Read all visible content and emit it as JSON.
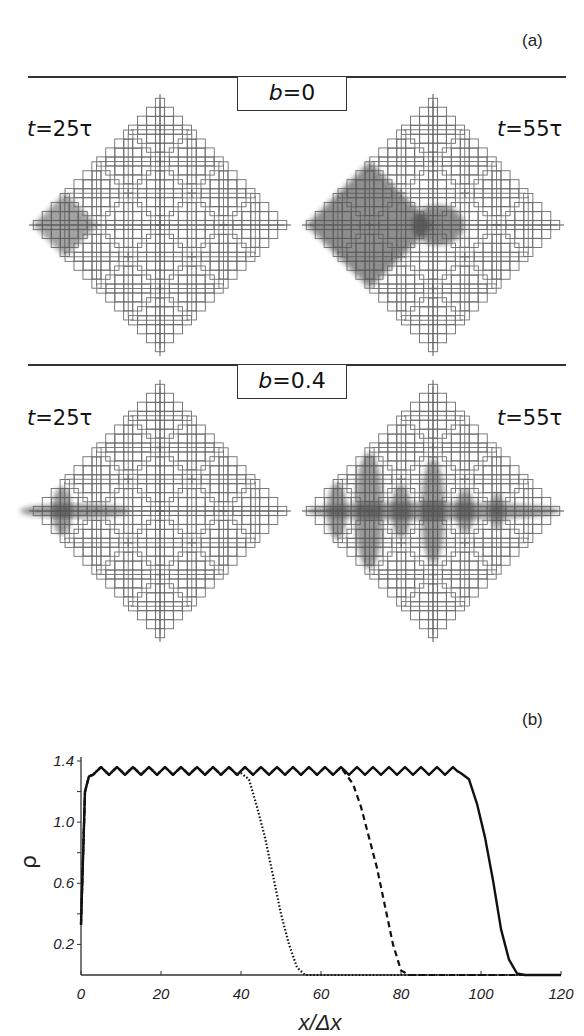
{
  "panel_a": {
    "label": "(a)",
    "rows": [
      {
        "param_var": "b",
        "param_eq": "=0",
        "snapshots": [
          {
            "t_var": "t",
            "t_eq": "=25τ",
            "spread": "left-corner-subsquare"
          },
          {
            "t_var": "t",
            "t_eq": "=55τ",
            "spread": "left-quadrant-filled"
          }
        ]
      },
      {
        "param_var": "b",
        "param_eq": "=0.4",
        "snapshots": [
          {
            "t_var": "t",
            "t_eq": "=25τ",
            "spread": "horizontal-axis-streak-to-center"
          },
          {
            "t_var": "t",
            "t_eq": "=55τ",
            "spread": "horizontal-axis-full-with-branches"
          }
        ]
      }
    ]
  },
  "panel_b": {
    "label": "(b)"
  },
  "chart_data": {
    "type": "line",
    "title": "",
    "xlabel": "x/Δx",
    "ylabel": "ρ",
    "xlim": [
      0,
      120
    ],
    "ylim": [
      0,
      1.4
    ],
    "x_ticks": [
      "0",
      "20",
      "40",
      "60",
      "80",
      "100",
      "120"
    ],
    "y_ticks": [
      "0.2",
      "0.6",
      "1.0",
      "1.4"
    ],
    "grid": false,
    "legend": null,
    "series": [
      {
        "name": "dotted",
        "style": "dotted",
        "x": [
          0,
          1,
          2,
          3,
          40,
          42,
          44,
          46,
          48,
          50,
          52,
          54,
          56,
          60,
          80,
          120
        ],
        "values": [
          0.33,
          1.2,
          1.3,
          1.32,
          1.32,
          1.28,
          1.1,
          0.9,
          0.65,
          0.4,
          0.2,
          0.05,
          0.0,
          0.0,
          0.0,
          0.0
        ]
      },
      {
        "name": "dashed",
        "style": "dashed",
        "x": [
          0,
          1,
          2,
          3,
          66,
          68,
          70,
          72,
          74,
          76,
          78,
          80,
          82,
          120
        ],
        "values": [
          0.33,
          1.2,
          1.3,
          1.32,
          1.32,
          1.25,
          1.1,
          0.9,
          0.7,
          0.45,
          0.2,
          0.03,
          0.0,
          0.0
        ]
      },
      {
        "name": "solid",
        "style": "solid",
        "x": [
          0,
          1,
          2,
          3,
          95,
          97,
          99,
          101,
          103,
          105,
          107,
          109,
          111,
          120
        ],
        "values": [
          0.33,
          1.2,
          1.3,
          1.33,
          1.32,
          1.28,
          1.12,
          0.9,
          0.62,
          0.3,
          0.1,
          0.01,
          0.0,
          0.0
        ]
      }
    ]
  }
}
